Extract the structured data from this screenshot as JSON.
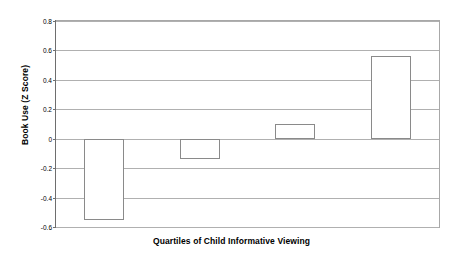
{
  "chart_data": {
    "type": "bar",
    "title": "",
    "subtitle": "",
    "xlabel": "Quartiles of Child Informative Viewing",
    "ylabel": "Book Use (Z Score)",
    "categories": [
      "1",
      "2",
      "3",
      "4"
    ],
    "values": [
      -0.55,
      -0.14,
      0.1,
      0.56
    ],
    "series": [
      {
        "name": "Book Use (Z Score)",
        "values": [
          -0.55,
          -0.14,
          0.1,
          0.56
        ]
      }
    ],
    "ylim": [
      -0.6,
      0.8
    ],
    "ytick_step": 0.2,
    "ytick_labels": [
      "0.8",
      "0.6",
      "0.4",
      "0.2",
      "0",
      "-0.2",
      "-0.4",
      "-0.6"
    ],
    "ytick_values": [
      0.8,
      0.6,
      0.4,
      0.2,
      0,
      -0.2,
      -0.4,
      -0.6
    ],
    "xtick_labels": [
      "",
      "",
      "",
      ""
    ],
    "grid": true,
    "grid_axis": "y",
    "legend": false,
    "legend_position": "none",
    "bar_fill": "#ffffff",
    "bar_border": "#8a8a8a",
    "gridline_color": "#b0b0b0",
    "axis_color": "#6e6e6e",
    "text_color": "#000000",
    "background": "#ffffff"
  }
}
